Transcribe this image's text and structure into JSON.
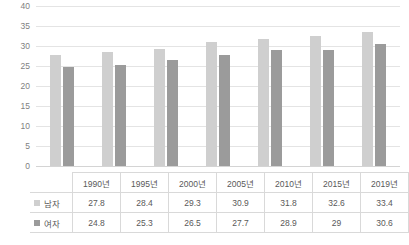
{
  "chart_data": {
    "type": "bar",
    "title": "",
    "subtitle": "",
    "xlabel": "",
    "ylabel": "",
    "ylim": [
      0,
      40
    ],
    "ytick_step": 5,
    "yticks": [
      40,
      35,
      30,
      25,
      20,
      15,
      10,
      5,
      0
    ],
    "grid": true,
    "legend_position": "table-row-labels",
    "categories": [
      "1990년",
      "1995년",
      "2000년",
      "2005년",
      "2010년",
      "2015년",
      "2019년"
    ],
    "series": [
      {
        "name": "남자",
        "color": "#cfcfcf",
        "values": [
          27.8,
          28.4,
          29.3,
          30.9,
          31.8,
          32.6,
          33.4
        ],
        "labels": [
          "27.8",
          "28.4",
          "29.3",
          "30.9",
          "31.8",
          "32.6",
          "33.4"
        ]
      },
      {
        "name": "여자",
        "color": "#9b9b9b",
        "values": [
          24.8,
          25.3,
          26.5,
          27.7,
          28.9,
          29.0,
          30.6
        ],
        "labels": [
          "24.8",
          "25.3",
          "26.5",
          "27.7",
          "28.9",
          "29",
          "30.6"
        ]
      }
    ]
  },
  "table": {
    "corner_label": "",
    "header": [
      "1990년",
      "1995년",
      "2000년",
      "2005년",
      "2010년",
      "2015년",
      "2019년"
    ],
    "rows": [
      {
        "label": "남자",
        "swatch": "male-swatch-icon",
        "cells": [
          "27.8",
          "28.4",
          "29.3",
          "30.9",
          "31.8",
          "32.6",
          "33.4"
        ]
      },
      {
        "label": "여자",
        "swatch": "female-swatch-icon",
        "cells": [
          "24.8",
          "25.3",
          "26.5",
          "27.7",
          "28.9",
          "29",
          "30.6"
        ]
      }
    ]
  },
  "colors": {
    "male_bar": "#cfcfcf",
    "female_bar": "#9b9b9b",
    "gridline": "#e4e4e4",
    "baseline": "#d4d4d4",
    "table_border": "#d9d9d9",
    "text": "#595959",
    "axis_text": "#7f7f7f",
    "background": "#ffffff"
  }
}
